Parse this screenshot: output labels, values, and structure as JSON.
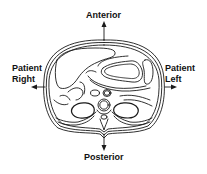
{
  "diagram": {
    "type": "anatomical-axial-cross-section",
    "labels": {
      "anterior": "Anterior",
      "posterior": "Posterior",
      "patient_right_line1": "Patient",
      "patient_right_line2": "Right",
      "patient_left_line1": "Patient",
      "patient_left_line2": "Left"
    },
    "colors": {
      "line": "#1a1a1a",
      "background": "#ffffff"
    }
  }
}
